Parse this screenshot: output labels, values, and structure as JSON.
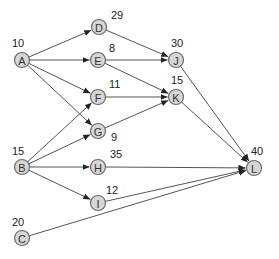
{
  "diagram": {
    "type": "activity-network",
    "colors": {
      "node_fill": "#d6d6d6",
      "node_stroke": "#6a6a6a",
      "edge": "#555555",
      "text": "#222222"
    },
    "nodes": [
      {
        "id": "A",
        "label": "A",
        "value": "10",
        "x": 22,
        "y": 60,
        "vx": 12,
        "vy": 43
      },
      {
        "id": "B",
        "label": "B",
        "value": "15",
        "x": 22,
        "y": 167,
        "vx": 12,
        "vy": 151
      },
      {
        "id": "C",
        "label": "C",
        "value": "20",
        "x": 22,
        "y": 238,
        "vx": 12,
        "vy": 222
      },
      {
        "id": "D",
        "label": "D",
        "value": "29",
        "x": 99,
        "y": 27,
        "vx": 111,
        "vy": 15
      },
      {
        "id": "E",
        "label": "E",
        "value": "8",
        "x": 98,
        "y": 60,
        "vx": 109,
        "vy": 48
      },
      {
        "id": "F",
        "label": "F",
        "value": "11",
        "x": 98,
        "y": 97,
        "vx": 109,
        "vy": 84
      },
      {
        "id": "G",
        "label": "G",
        "value": "9",
        "x": 98,
        "y": 131,
        "vx": 111,
        "vy": 137
      },
      {
        "id": "H",
        "label": "H",
        "value": "35",
        "x": 98,
        "y": 167,
        "vx": 110,
        "vy": 154
      },
      {
        "id": "I",
        "label": "I",
        "value": "12",
        "x": 98,
        "y": 203,
        "vx": 106,
        "vy": 190
      },
      {
        "id": "J",
        "label": "J",
        "value": "30",
        "x": 176,
        "y": 60,
        "vx": 171,
        "vy": 43
      },
      {
        "id": "K",
        "label": "K",
        "value": "15",
        "x": 176,
        "y": 97,
        "vx": 171,
        "vy": 80
      },
      {
        "id": "L",
        "label": "L",
        "value": "40",
        "x": 254,
        "y": 168,
        "vx": 251,
        "vy": 151
      }
    ],
    "edges": [
      {
        "from": "A",
        "to": "D",
        "arrow": true
      },
      {
        "from": "A",
        "to": "E",
        "arrow": true
      },
      {
        "from": "A",
        "to": "F",
        "arrow": true
      },
      {
        "from": "A",
        "to": "G",
        "arrow": true
      },
      {
        "from": "B",
        "to": "F",
        "arrow": true
      },
      {
        "from": "B",
        "to": "G",
        "arrow": true
      },
      {
        "from": "B",
        "to": "H",
        "arrow": true
      },
      {
        "from": "B",
        "to": "I",
        "arrow": true
      },
      {
        "from": "D",
        "to": "J",
        "arrow": true
      },
      {
        "from": "E",
        "to": "J",
        "arrow": true
      },
      {
        "from": "E",
        "to": "K",
        "arrow": true
      },
      {
        "from": "F",
        "to": "K",
        "arrow": true
      },
      {
        "from": "G",
        "to": "K",
        "arrow": true
      },
      {
        "from": "J",
        "to": "L",
        "arrow": true
      },
      {
        "from": "K",
        "to": "L",
        "arrow": true
      },
      {
        "from": "H",
        "to": "L",
        "arrow": true
      },
      {
        "from": "I",
        "to": "L",
        "arrow": true
      },
      {
        "from": "C",
        "to": "L",
        "arrow": true
      }
    ]
  }
}
